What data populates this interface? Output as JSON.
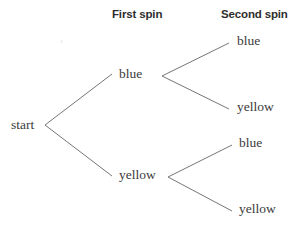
{
  "figure": {
    "type": "tree-diagram",
    "title_visible": false,
    "background_color": "#ffffff",
    "line_color": "#767676",
    "text_color": "#3b3b3b",
    "header_color": "#2e2e2e",
    "width": 300,
    "height": 227
  },
  "headers": {
    "first": "First spin",
    "second": "Second spin"
  },
  "root": {
    "label": "start"
  },
  "first_spin": {
    "nodes": [
      {
        "label": "blue"
      },
      {
        "label": "yellow"
      }
    ]
  },
  "second_spin": {
    "under_blue": [
      {
        "label": "blue"
      },
      {
        "label": "yellow"
      }
    ],
    "under_yellow": [
      {
        "label": "blue"
      },
      {
        "label": "yellow"
      }
    ]
  },
  "chart_data": {
    "type": "tree",
    "title": "",
    "columns": [
      "",
      "First spin",
      "Second spin"
    ],
    "nodes": [
      {
        "id": "start",
        "label": "start",
        "level": 0,
        "parent": null
      },
      {
        "id": "s1-blue",
        "label": "blue",
        "level": 1,
        "parent": "start"
      },
      {
        "id": "s1-yellow",
        "label": "yellow",
        "level": 1,
        "parent": "start"
      },
      {
        "id": "s2-blue-blue",
        "label": "blue",
        "level": 2,
        "parent": "s1-blue"
      },
      {
        "id": "s2-blue-yellow",
        "label": "yellow",
        "level": 2,
        "parent": "s1-blue"
      },
      {
        "id": "s2-yellow-blue",
        "label": "blue",
        "level": 2,
        "parent": "s1-yellow"
      },
      {
        "id": "s2-yellow-yellow",
        "label": "yellow",
        "level": 2,
        "parent": "s1-yellow"
      }
    ],
    "edges": [
      {
        "from": "start",
        "to": "s1-blue"
      },
      {
        "from": "start",
        "to": "s1-yellow"
      },
      {
        "from": "s1-blue",
        "to": "s2-blue-blue"
      },
      {
        "from": "s1-blue",
        "to": "s2-blue-yellow"
      },
      {
        "from": "s1-yellow",
        "to": "s2-yellow-blue"
      },
      {
        "from": "s1-yellow",
        "to": "s2-yellow-yellow"
      }
    ],
    "outcomes": [
      [
        "blue",
        "blue"
      ],
      [
        "blue",
        "yellow"
      ],
      [
        "yellow",
        "blue"
      ],
      [
        "yellow",
        "yellow"
      ]
    ]
  }
}
